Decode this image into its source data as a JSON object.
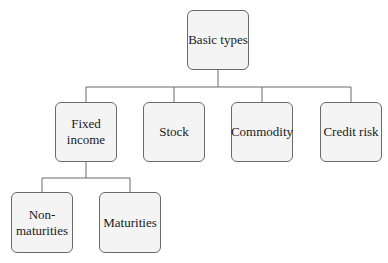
{
  "diagram": {
    "type": "hierarchy",
    "root": {
      "label": "Basic types",
      "children": [
        {
          "label": "Fixed\nincome",
          "children": [
            {
              "label": "Non-\nmaturities"
            },
            {
              "label": "Maturities"
            }
          ]
        },
        {
          "label": "Stock"
        },
        {
          "label": "Commodity"
        },
        {
          "label": "Credit risk"
        }
      ]
    },
    "colors": {
      "box_fill": "#f4f4f4",
      "box_border": "#6a6a6a",
      "line": "#6a6a6a",
      "text": "#1a1a1a"
    }
  }
}
